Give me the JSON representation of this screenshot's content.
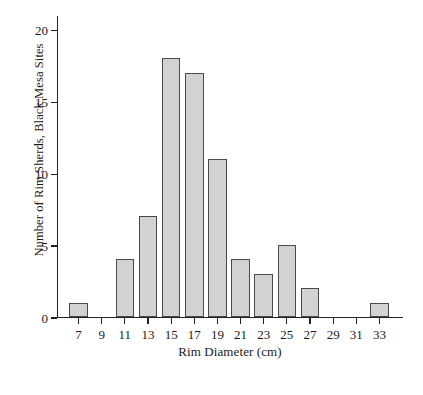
{
  "chart_data": {
    "type": "bar",
    "title": "",
    "subtitle": "",
    "xlabel": "Rim Diameter (cm)",
    "ylabel": "Number of Rim Sherds, Black Mesa Sites",
    "categories": [
      "7",
      "9",
      "11",
      "13",
      "15",
      "17",
      "19",
      "21",
      "23",
      "25",
      "27",
      "29",
      "31",
      "33"
    ],
    "values": [
      1,
      0,
      4,
      7,
      18,
      17,
      11,
      4,
      3,
      5,
      2,
      0,
      0,
      1
    ],
    "xlim": [
      6,
      34
    ],
    "ylim": [
      0,
      21
    ],
    "y_ticks": [
      0,
      5,
      10,
      15,
      20
    ],
    "y_tick_labels": [
      "0",
      "5",
      "10",
      "15",
      "20"
    ],
    "grid": false,
    "legend": null,
    "bar_fill_color": "#d2d2d2",
    "bar_edge_color": "#4a4a4a",
    "axis_color": "#222222",
    "background_color": "#ffffff"
  }
}
